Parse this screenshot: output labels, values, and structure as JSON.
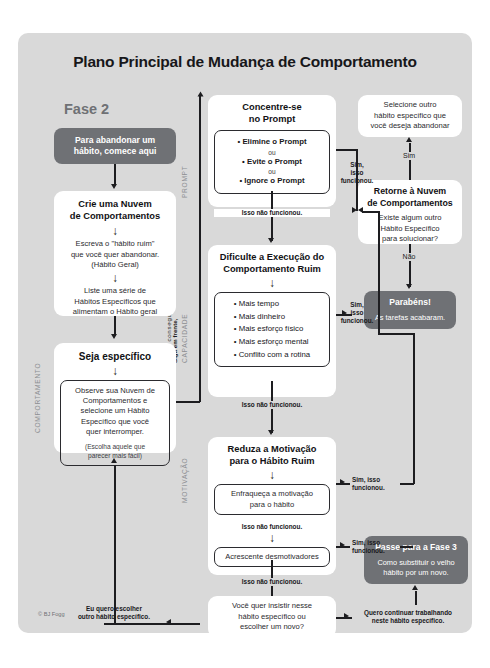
{
  "poster": {
    "title": "Plano Principal de Mudança de Comportamento",
    "credit": "© BJ Fogg",
    "phase_label": "Fase 2",
    "accent_gray": "#6f7175",
    "background": "#d9d9d9",
    "line_color": "#1d1d20"
  },
  "vertical_labels": {
    "comportamento": "COMPORTAMENTO",
    "prompt": "PROMPT",
    "capacidade": "CAPACIDADE",
    "motivacao": "MOTIVAÇÃO",
    "keep_going_bold": "Siga em frente,",
    "keep_going_rest": "Você vai conseguir."
  },
  "left_column": {
    "start_cta": {
      "line1": "Para abandonar um",
      "line2": "hábito, comece aqui"
    },
    "cloud_box": {
      "heading_line1": "Crie uma Nuvem",
      "heading_line2": "de Comportamentos",
      "arrow": "↓",
      "step1_line1": "Escreva o \"hábito ruim\"",
      "step1_line2": "que você quer abandonar.",
      "step1_line3": "(Hábito Geral)",
      "arrow2": "↓",
      "step2_line1": "Liste uma série de",
      "step2_line2": "Hábitos Específicos que",
      "step2_line3": "alimentam o Hábito geral"
    },
    "specific_box": {
      "heading": "Seja específico",
      "arrow": "↓",
      "inner_line1": "Observe sua Nuvem de",
      "inner_line2": "Comportamentos e",
      "inner_line3": "selecione um Hábito",
      "inner_line4": "Específico que você",
      "inner_line5": "quer interromper.",
      "note_line1": "(Escolha aquele que",
      "note_line2": "parecer mais fácil)"
    }
  },
  "middle_column": {
    "prompt_box": {
      "heading_line1": "Concentre-se",
      "heading_line2": "no Prompt",
      "bullets": [
        "Elimine o Prompt",
        "Evite o Prompt",
        "Ignore o Prompt"
      ],
      "or1": "ou",
      "or2": "ou",
      "fail_label": "Isso não funcionou."
    },
    "ability_box": {
      "heading_line1": "Dificulte a Execução do",
      "heading_line2": "Comportamento Ruim",
      "arrow": "↓",
      "bullets": [
        "Mais tempo",
        "Mais dinheiro",
        "Mais esforço físico",
        "Mais esforço mental",
        "Conflito com a rotina"
      ],
      "fail_label": "Isso não funcionou."
    },
    "motivation_box": {
      "heading_line1": "Reduza a Motivação",
      "heading_line2": "para o Hábito Ruim",
      "arrow": "↓",
      "inner1_line1": "Enfraqueça a motivação",
      "inner1_line2": "para o hábito",
      "fail_label_1": "Isso não funcionou.",
      "arrow2": "↓",
      "inner2": "Acrescente desmotivadores",
      "fail_label_2": "Isso não funcionou."
    },
    "decision_box": {
      "line1": "Você quer insistir nesse",
      "line2": "hábito específico ou",
      "line3": "escolher um novo?"
    }
  },
  "right_column": {
    "select_other_box": {
      "line1": "Selecione outro",
      "line2": "hábito específico que",
      "line3": "você deseja abandonar"
    },
    "yes_label": "Sim",
    "return_cloud_box": {
      "heading_line1": "Retorne à Nuvem",
      "heading_line2": "de Comportamentos",
      "q_line1": "Existe algum outro",
      "q_line2": "Hábito Específico",
      "q_line3": "para solucionar?"
    },
    "no_label": "Não",
    "congrats_cta": {
      "line1": "Parabéns!",
      "line2": "As tarefas acabaram."
    },
    "phase3_cta": {
      "line1": "Passe para a Fase 3",
      "line2": "Como substituir o velho",
      "line3": "hábito por um novo."
    }
  },
  "edge_labels": {
    "success_prompt": {
      "l1": "Sim,",
      "l2": "isso",
      "l3": "funcionou."
    },
    "success_ability": {
      "l1": "Sim,",
      "l2": "isso",
      "l3": "funcionou."
    },
    "success_mot1": {
      "l1": "Sim, isso",
      "l2": "funcionou."
    },
    "success_mot2": {
      "l1": "Sim, isso",
      "l2": "funcionou."
    },
    "keep_working": {
      "l1": "Quero continuar trabalhando",
      "l2": "neste hábito específico."
    },
    "choose_other": {
      "l1": "Eu quero escolher",
      "l2": "outro hábito específico."
    }
  }
}
